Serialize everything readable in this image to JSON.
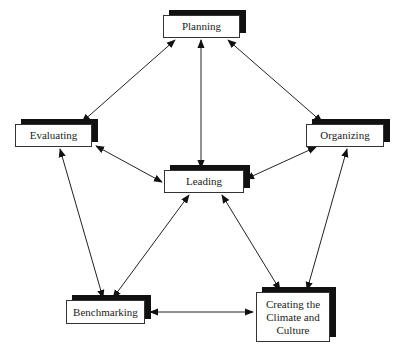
{
  "diagram": {
    "type": "cycle-network",
    "nodes": [
      {
        "id": "planning",
        "label": "Planning",
        "x": 163,
        "y": 15,
        "w": 77,
        "h": 23
      },
      {
        "id": "evaluating",
        "label": "Evaluating",
        "x": 15,
        "y": 124,
        "w": 77,
        "h": 23
      },
      {
        "id": "organizing",
        "label": "Organizing",
        "x": 306,
        "y": 124,
        "w": 78,
        "h": 23
      },
      {
        "id": "leading",
        "label": "Leading",
        "x": 164,
        "y": 170,
        "w": 80,
        "h": 23
      },
      {
        "id": "benchmarking",
        "label": "Benchmarking",
        "x": 66,
        "y": 300,
        "w": 79,
        "h": 24
      },
      {
        "id": "creating",
        "label": "Creating the Climate and Culture",
        "x": 256,
        "y": 292,
        "w": 74,
        "h": 50
      }
    ],
    "edges": [
      {
        "from": "planning",
        "to": "evaluating",
        "bidirectional": true,
        "x1": 175,
        "y1": 40,
        "x2": 82,
        "y2": 122
      },
      {
        "from": "planning",
        "to": "leading",
        "bidirectional": true,
        "x1": 201,
        "y1": 40,
        "x2": 201,
        "y2": 168
      },
      {
        "from": "planning",
        "to": "organizing",
        "bidirectional": true,
        "x1": 228,
        "y1": 40,
        "x2": 322,
        "y2": 122
      },
      {
        "from": "evaluating",
        "to": "leading",
        "bidirectional": true,
        "x1": 96,
        "y1": 146,
        "x2": 162,
        "y2": 182
      },
      {
        "from": "organizing",
        "to": "leading",
        "bidirectional": true,
        "x1": 316,
        "y1": 147,
        "x2": 246,
        "y2": 179
      },
      {
        "from": "evaluating",
        "to": "benchmarking",
        "bidirectional": true,
        "x1": 60,
        "y1": 149,
        "x2": 103,
        "y2": 298
      },
      {
        "from": "leading",
        "to": "benchmarking",
        "bidirectional": true,
        "x1": 189,
        "y1": 195,
        "x2": 113,
        "y2": 298
      },
      {
        "from": "leading",
        "to": "creating",
        "bidirectional": true,
        "x1": 222,
        "y1": 195,
        "x2": 280,
        "y2": 290
      },
      {
        "from": "organizing",
        "to": "creating",
        "bidirectional": true,
        "x1": 347,
        "y1": 149,
        "x2": 307,
        "y2": 290
      },
      {
        "from": "benchmarking",
        "to": "creating",
        "bidirectional": true,
        "x1": 150,
        "y1": 312,
        "x2": 253,
        "y2": 312
      }
    ],
    "colors": {
      "line": "#222222",
      "shadow": "#111111",
      "box_border": "#333333",
      "text": "#222222"
    }
  }
}
